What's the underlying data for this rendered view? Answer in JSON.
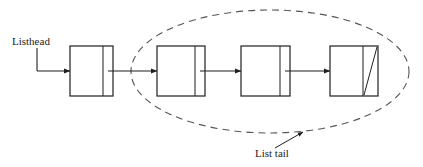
{
  "diagram": {
    "canvas": {
      "width": 423,
      "height": 167,
      "background": "#ffffff"
    },
    "stroke_color": "#2b2b2b",
    "dash_color": "#555555",
    "labels": {
      "listhead": "Listhead",
      "list_tail": "List tail"
    },
    "nodes": [
      {
        "name": "node-1",
        "x": 70,
        "y": 46,
        "width": 43,
        "height": 50,
        "divider_x": 103,
        "null_slash": false
      },
      {
        "name": "node-2",
        "x": 157,
        "y": 46,
        "width": 48,
        "height": 50,
        "divider_x": 195,
        "null_slash": false
      },
      {
        "name": "node-3",
        "x": 241,
        "y": 46,
        "width": 49,
        "height": 50,
        "divider_x": 280,
        "null_slash": false
      },
      {
        "name": "node-4",
        "x": 330,
        "y": 46,
        "width": 48,
        "height": 50,
        "divider_x": 363,
        "null_slash": true
      }
    ],
    "arrows": [
      {
        "name": "arrow-head-to-node-1",
        "from_x": 37,
        "from_y": 71,
        "to_x": 70,
        "to_y": 71
      },
      {
        "name": "arrow-node-1-to-node-2",
        "from_x": 108,
        "from_y": 71,
        "to_x": 157,
        "to_y": 71
      },
      {
        "name": "arrow-node-2-to-node-3",
        "from_x": 200,
        "from_y": 71,
        "to_x": 241,
        "to_y": 71
      },
      {
        "name": "arrow-node-3-to-node-4",
        "from_x": 285,
        "from_y": 71,
        "to_x": 330,
        "to_y": 71
      }
    ],
    "listhead_connector": {
      "text_x": 12,
      "text_y": 45,
      "elbow_x": 37,
      "elbow_top_y": 48,
      "elbow_bottom_y": 71
    },
    "tail_ellipse": {
      "name": "list-tail-ellipse",
      "center_x": 270,
      "center_y": 71.5,
      "radius_x": 139,
      "radius_y": 61.5,
      "dash_pattern": "7 5"
    },
    "tail_callout": {
      "text_x": 255,
      "text_y": 157,
      "line_from_x": 275,
      "line_from_y": 148,
      "line_to_x": 303,
      "line_to_y": 132
    }
  }
}
